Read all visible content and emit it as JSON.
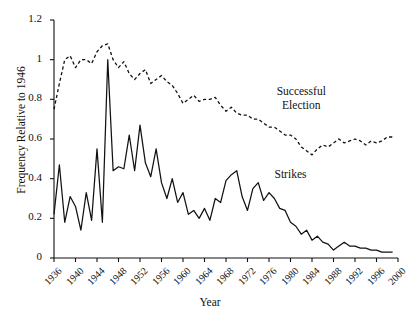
{
  "chart_data": {
    "type": "line",
    "title": "",
    "xlabel": "Year",
    "ylabel": "Frequency Relative to 1946",
    "xlim": [
      1936,
      2000
    ],
    "ylim": [
      0,
      1.2
    ],
    "grid": false,
    "legend_position": "inline-annotations",
    "xticks": [
      "1936",
      "1940",
      "1944",
      "1948",
      "1952",
      "1956",
      "1960",
      "1964",
      "1968",
      "1972",
      "1976",
      "1980",
      "1984",
      "1988",
      "1992",
      "1996",
      "2000"
    ],
    "xtick_values": [
      1936,
      1940,
      1944,
      1948,
      1952,
      1956,
      1960,
      1964,
      1968,
      1972,
      1976,
      1980,
      1984,
      1988,
      1992,
      1996,
      2000
    ],
    "yticks": [
      "0",
      "0.2",
      "0.4",
      "0.6",
      "0.8",
      "1",
      "1.2"
    ],
    "ytick_values": [
      0,
      0.2,
      0.4,
      0.6,
      0.8,
      1.0,
      1.2
    ],
    "annotations": [
      {
        "text": "Successful Election",
        "lines": [
          "Successful",
          "Election"
        ],
        "x": 1982,
        "y": 0.8
      },
      {
        "text": "Strikes",
        "lines": [
          "Strikes"
        ],
        "x": 1980,
        "y": 0.42
      }
    ],
    "x": [
      1936,
      1937,
      1938,
      1939,
      1940,
      1941,
      1942,
      1943,
      1944,
      1945,
      1946,
      1947,
      1948,
      1949,
      1950,
      1951,
      1952,
      1953,
      1954,
      1955,
      1956,
      1957,
      1958,
      1959,
      1960,
      1961,
      1962,
      1963,
      1964,
      1965,
      1966,
      1967,
      1968,
      1969,
      1970,
      1971,
      1972,
      1973,
      1974,
      1975,
      1976,
      1977,
      1978,
      1979,
      1980,
      1981,
      1982,
      1983,
      1984,
      1985,
      1986,
      1987,
      1988,
      1989,
      1990,
      1991,
      1992,
      1993,
      1994,
      1995,
      1996,
      1997,
      1998,
      1999
    ],
    "series": [
      {
        "name": "Strikes",
        "style": "solid",
        "color": "#111111",
        "values": [
          0.22,
          0.47,
          0.18,
          0.31,
          0.26,
          0.14,
          0.33,
          0.19,
          0.55,
          0.18,
          1.0,
          0.44,
          0.46,
          0.45,
          0.62,
          0.44,
          0.67,
          0.48,
          0.41,
          0.55,
          0.38,
          0.3,
          0.4,
          0.28,
          0.33,
          0.22,
          0.24,
          0.2,
          0.25,
          0.19,
          0.3,
          0.28,
          0.39,
          0.42,
          0.44,
          0.31,
          0.24,
          0.35,
          0.38,
          0.29,
          0.33,
          0.3,
          0.25,
          0.24,
          0.18,
          0.16,
          0.12,
          0.14,
          0.09,
          0.11,
          0.08,
          0.07,
          0.04,
          0.06,
          0.08,
          0.06,
          0.06,
          0.05,
          0.05,
          0.04,
          0.04,
          0.03,
          0.03,
          0.03
        ]
      },
      {
        "name": "Successful Election",
        "style": "dashed",
        "color": "#111111",
        "values": [
          0.75,
          0.88,
          1.0,
          1.02,
          0.96,
          1.0,
          1.0,
          0.98,
          1.04,
          1.07,
          1.08,
          1.0,
          0.96,
          0.99,
          0.93,
          0.9,
          0.93,
          0.95,
          0.88,
          0.9,
          0.92,
          0.89,
          0.87,
          0.83,
          0.78,
          0.8,
          0.82,
          0.79,
          0.8,
          0.8,
          0.81,
          0.77,
          0.74,
          0.76,
          0.73,
          0.72,
          0.72,
          0.7,
          0.7,
          0.68,
          0.66,
          0.66,
          0.64,
          0.62,
          0.62,
          0.6,
          0.56,
          0.54,
          0.52,
          0.55,
          0.57,
          0.56,
          0.58,
          0.6,
          0.58,
          0.59,
          0.6,
          0.59,
          0.57,
          0.59,
          0.58,
          0.59,
          0.61,
          0.61
        ]
      }
    ]
  }
}
